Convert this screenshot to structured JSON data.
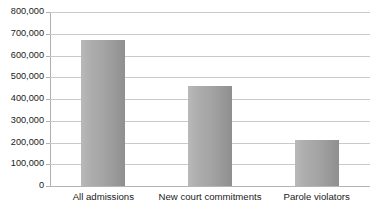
{
  "chart_data": {
    "type": "bar",
    "title": "",
    "subtitle": "",
    "xlabel": "",
    "ylabel": "",
    "categories": [
      "All admissions",
      "New court commitments",
      "Parole violators"
    ],
    "values": [
      670000,
      460000,
      213000
    ],
    "ylim": [
      0,
      800000
    ],
    "y_ticks": [
      0,
      100000,
      200000,
      300000,
      400000,
      500000,
      600000,
      700000,
      800000
    ],
    "y_tick_labels": [
      "0",
      "100,000",
      "200,000",
      "300,000",
      "400,000",
      "500,000",
      "600,000",
      "700,000",
      "800,000"
    ],
    "grid": true,
    "grid_axis": "y",
    "legend": false,
    "legend_position": "none",
    "bar_color": "#a5a5a5",
    "gridline_color": "#c9c9c9",
    "axis_color": "#b0b0b0",
    "text_color": "#1a1a1a",
    "background_color": "#ffffff"
  }
}
